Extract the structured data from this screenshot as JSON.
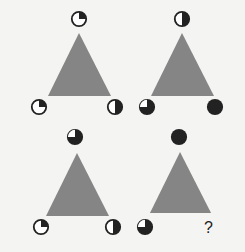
{
  "puzzle": {
    "colors": {
      "triangle": "#858585",
      "fill": "#222222",
      "empty": "#ffffff",
      "background": "#f4f4f2"
    },
    "panels": [
      {
        "id": "panel-1",
        "top": "q-tr",
        "bottom_left": "q-tr",
        "bottom_right": "half-right"
      },
      {
        "id": "panel-2",
        "top": "half-right",
        "bottom_left": "black-q-tl-white",
        "bottom_right": "full"
      },
      {
        "id": "panel-3",
        "top": "black-q-tl-white",
        "bottom_left": "q-tr",
        "bottom_right": "half-right"
      },
      {
        "id": "panel-4",
        "top": "full",
        "bottom_left": "black-q-tl-white",
        "bottom_right": "?"
      }
    ],
    "question_mark": "?"
  }
}
